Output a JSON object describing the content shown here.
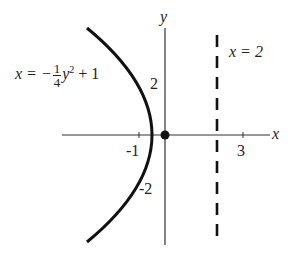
{
  "diagram": {
    "type": "parabola-graph",
    "axes": {
      "x_label": "x",
      "y_label": "y"
    },
    "tick_labels": {
      "x": [
        "-1",
        "3"
      ],
      "y": [
        "2",
        "-2"
      ]
    },
    "curve": {
      "equation_lhs": "x = −",
      "equation_frac_num": "1",
      "equation_frac_den": "4",
      "equation_var": "y",
      "equation_exp": "2",
      "equation_rest": " + 1",
      "equation_text": "x = -1/4 y^2 + 1",
      "vertex": [
        1,
        0
      ]
    },
    "directrix": {
      "label": "x = 2",
      "x": 2,
      "style": "dashed"
    },
    "focus": {
      "x": 0,
      "y": 0,
      "marker": "filled-dot"
    },
    "colors": {
      "stroke": "#111111",
      "background": "#ffffff"
    }
  }
}
